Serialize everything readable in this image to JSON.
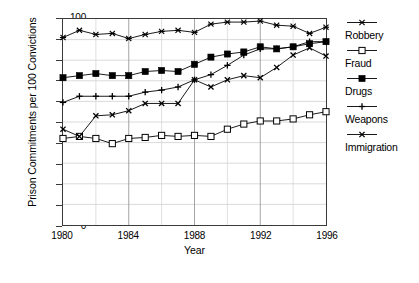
{
  "chart_data": {
    "type": "line",
    "title": "",
    "xlabel": "Year",
    "ylabel": "Prison Commitments per 100 Convictions",
    "xlim": [
      1980,
      1996
    ],
    "ylim": [
      0,
      100
    ],
    "ytick_step": 10,
    "xtick_step": 4,
    "x_minor_step": 2,
    "grid": "both-minor",
    "legend_position": "right",
    "x": [
      1980,
      1981,
      1982,
      1983,
      1984,
      1985,
      1986,
      1987,
      1988,
      1989,
      1990,
      1991,
      1992,
      1993,
      1994,
      1995,
      1996
    ],
    "series": [
      {
        "name": "Robbery",
        "marker": "asterisk",
        "color": "#000000",
        "values": [
          91.0,
          94.5,
          92.5,
          93.0,
          90.5,
          92.5,
          94.0,
          94.5,
          93.5,
          97.5,
          98.5,
          98.5,
          99.0,
          97.0,
          96.5,
          93.0,
          96.0
        ]
      },
      {
        "name": "Fraud",
        "marker": "open-square",
        "color": "#000000",
        "values": [
          42.0,
          43.0,
          42.0,
          39.5,
          42.0,
          42.5,
          43.5,
          43.0,
          43.5,
          43.0,
          46.5,
          49.0,
          50.5,
          50.5,
          51.5,
          53.5,
          55.0
        ]
      },
      {
        "name": "Drugs",
        "marker": "filled-square",
        "color": "#000000",
        "values": [
          71.5,
          72.5,
          73.5,
          72.5,
          72.5,
          74.5,
          75.0,
          74.5,
          78.0,
          81.5,
          83.0,
          84.0,
          86.5,
          85.5,
          86.5,
          88.0,
          89.0
        ]
      },
      {
        "name": "Weapons",
        "marker": "plus",
        "color": "#000000",
        "values": [
          59.5,
          62.5,
          62.5,
          62.5,
          62.5,
          64.5,
          65.5,
          67.0,
          70.5,
          73.0,
          77.5,
          82.5,
          85.5,
          85.5,
          86.5,
          89.0,
          89.0
        ]
      },
      {
        "name": "Immigration",
        "marker": "cross",
        "color": "#000000",
        "values": [
          46.5,
          43.0,
          53.0,
          53.5,
          55.5,
          59.0,
          59.0,
          59.0,
          70.5,
          67.0,
          70.5,
          72.5,
          71.5,
          76.5,
          82.5,
          86.0,
          82.0
        ]
      }
    ],
    "ytick_labels": [
      "0",
      "10",
      "20",
      "30",
      "40",
      "50",
      "60",
      "70",
      "80",
      "90",
      "100"
    ],
    "xtick_labels": [
      "1980",
      "1984",
      "1988",
      "1992",
      "1996"
    ]
  }
}
